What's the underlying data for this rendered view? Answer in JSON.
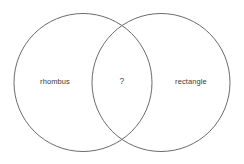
{
  "diagram": {
    "type": "venn-two-set",
    "background_color": "#ffffff",
    "stroke_color": "#6b6b6b",
    "text_color": "#3a3a3a",
    "width": 244,
    "height": 164,
    "sets": [
      {
        "id": "left-set",
        "label": "rhombus",
        "label_x": 55,
        "label_y": 82,
        "cx": 83,
        "cy": 82.5,
        "r": 69
      },
      {
        "id": "right-set",
        "label": "rectangle",
        "label_x": 191,
        "label_y": 82,
        "cx": 161,
        "cy": 82.5,
        "r": 69
      }
    ],
    "intersection": {
      "id": "intersection-region",
      "label": "?",
      "label_x": 122,
      "label_y": 81
    }
  }
}
